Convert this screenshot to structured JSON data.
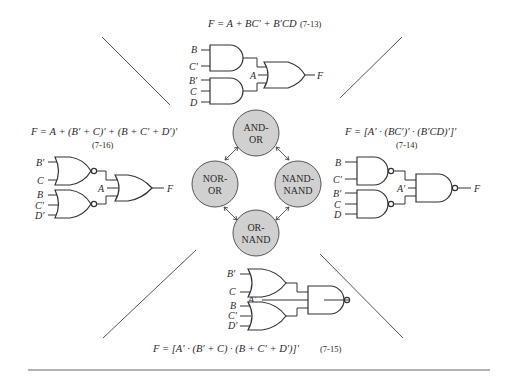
{
  "figure": {
    "top": {
      "equation": "F = A + BC′ + B′CD",
      "equation_number": "(7-13)",
      "inputs": [
        "B",
        "C′",
        "B′",
        "C",
        "D"
      ],
      "extra_input": "A",
      "output": "F",
      "first_level": "AND",
      "second_level": "OR"
    },
    "right": {
      "equation": "F = [A′ · (BC′)′ · (B′CD)′]′",
      "equation_number": "(7-14)",
      "inputs": [
        "B",
        "C′",
        "B′",
        "C",
        "D"
      ],
      "extra_input": "A′",
      "output": "F",
      "first_level": "NAND",
      "second_level": "NAND"
    },
    "bottom": {
      "equation": "F = [A′ · (B′ + C) · (B + C′ + D′)]′",
      "equation_number": "(7-15)",
      "inputs": [
        "B′",
        "C",
        "B",
        "C′",
        "D′"
      ],
      "extra_input": "A′",
      "output": "F",
      "first_level": "OR",
      "second_level": "NAND"
    },
    "left": {
      "equation": "F = A + (B′ + C)′ + (B + C′ + D′)′",
      "equation_number": "(7-16)",
      "inputs": [
        "B′",
        "C",
        "B",
        "C′",
        "D′"
      ],
      "extra_input": "A",
      "output": "F",
      "first_level": "NOR",
      "second_level": "OR"
    },
    "nodes": {
      "top": [
        "AND-",
        "OR"
      ],
      "right": [
        "NAND-",
        "NAND"
      ],
      "bottom": [
        "OR-",
        "NAND"
      ],
      "left": [
        "NOR-",
        "OR"
      ]
    },
    "colors": {
      "node_fill": "#d0d0d0",
      "line": "#333333"
    }
  }
}
